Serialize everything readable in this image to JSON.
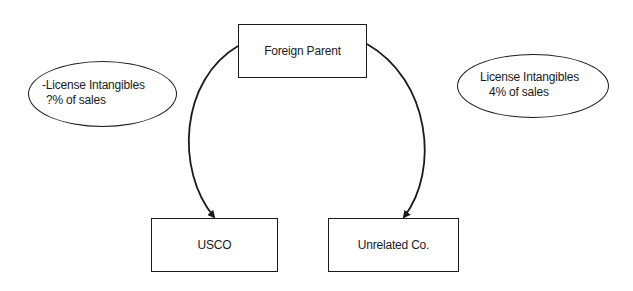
{
  "diagram": {
    "nodes": {
      "foreign_parent": {
        "label": "Foreign Parent"
      },
      "usco": {
        "label": "USCO"
      },
      "unrelated": {
        "label": "Unrelated Co."
      }
    },
    "annotations": {
      "left": {
        "line1": "-License Intangibles",
        "line2": "?% of sales"
      },
      "right": {
        "line1": "License Intangibles",
        "line2": "4% of sales"
      }
    },
    "edges": [
      {
        "from": "Foreign Parent",
        "to": "USCO",
        "style": "curved-arrow"
      },
      {
        "from": "Foreign Parent",
        "to": "Unrelated Co.",
        "style": "curved-arrow"
      }
    ],
    "colors": {
      "stroke": "#1a1a1a",
      "background": "#ffffff"
    }
  }
}
